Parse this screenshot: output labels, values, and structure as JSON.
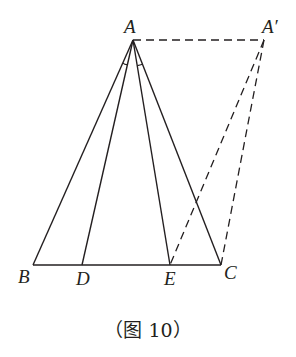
{
  "diagram": {
    "points": {
      "A": {
        "label": "A",
        "x": 133,
        "y": 40
      },
      "A_prime": {
        "label": "A′",
        "x": 264,
        "y": 40
      },
      "B": {
        "label": "B",
        "x": 33,
        "y": 265
      },
      "D": {
        "label": "D",
        "x": 82,
        "y": 265
      },
      "E": {
        "label": "E",
        "x": 170,
        "y": 265
      },
      "C": {
        "label": "C",
        "x": 221,
        "y": 265
      }
    },
    "solid_segments": [
      "AB",
      "AD",
      "AE",
      "AC",
      "BC"
    ],
    "dashed_segments": [
      "AA′",
      "A′E",
      "A′C"
    ],
    "angle_marks": [
      "∠BAD",
      "∠EAC"
    ],
    "caption": "（图 10）"
  }
}
